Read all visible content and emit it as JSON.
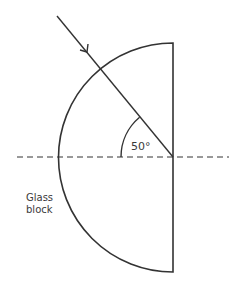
{
  "diagram": {
    "type": "optics-refraction",
    "labels": {
      "angle": "50°",
      "block_line1": "Glass",
      "block_line2": "block"
    },
    "angle_value_deg": 50,
    "colors": {
      "stroke": "#333333",
      "text": "#3a3a3a",
      "background": "#ffffff"
    },
    "geometry": {
      "center": [
        173,
        157
      ],
      "radius": 114,
      "normal_dashed_y": 157,
      "ray_start": [
        57,
        16
      ],
      "ray_end": [
        173,
        157
      ]
    }
  }
}
